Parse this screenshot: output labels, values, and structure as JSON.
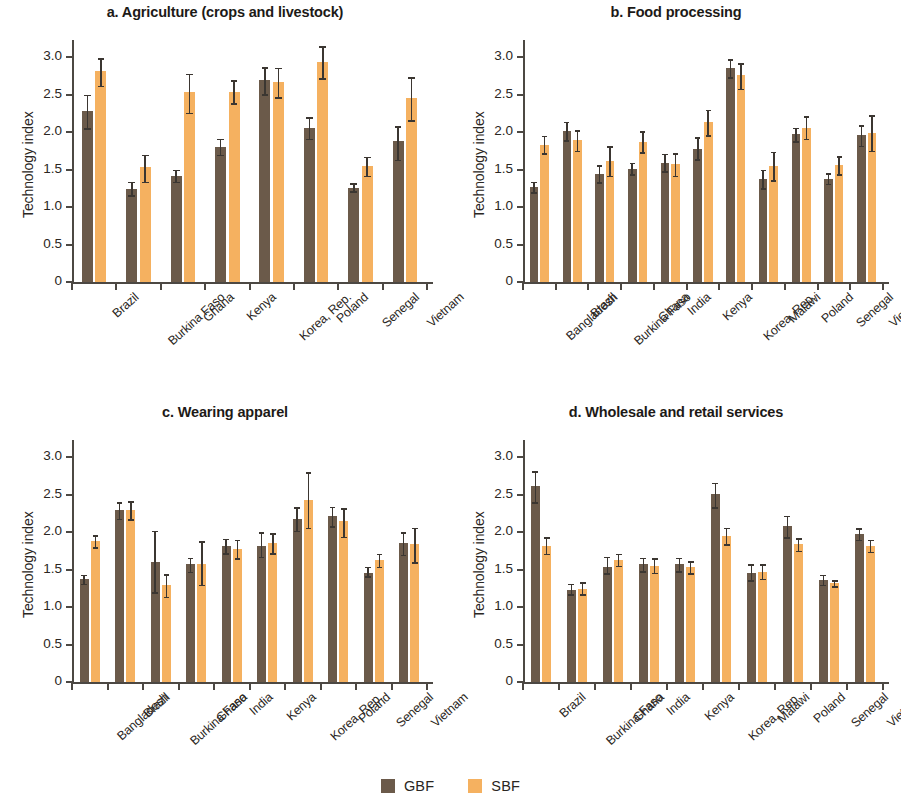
{
  "figure": {
    "ylabel": "Technology index",
    "ytick_labels": [
      "0",
      "0.5",
      "1.0",
      "1.5",
      "2.0",
      "2.5",
      "3.0"
    ]
  },
  "legend": {
    "position": "bottom-center",
    "items": [
      {
        "label": "GBF",
        "color": "#6b5a4a"
      },
      {
        "label": "SBF",
        "color": "#f5b160"
      }
    ]
  },
  "chart_data": [
    {
      "type": "bar",
      "panel": "a",
      "title": "a. Agriculture (crops and livestock)",
      "xlabel": "",
      "ylabel": "Technology index",
      "ylim": [
        0,
        3.15
      ],
      "yticks": [
        0,
        0.5,
        1.0,
        1.5,
        2.0,
        2.5,
        3.0
      ],
      "grid": false,
      "categories": [
        "Brazil",
        "Burkina Faso",
        "Ghana",
        "Kenya",
        "Korea, Rep.",
        "Poland",
        "Senegal",
        "Vietnam"
      ],
      "series": [
        {
          "name": "GBF",
          "color": "#6b5a4a",
          "values": [
            2.28,
            1.24,
            1.41,
            1.8,
            2.7,
            2.06,
            1.26,
            1.88
          ],
          "err_low": [
            2.05,
            1.16,
            1.34,
            1.7,
            2.51,
            1.91,
            1.21,
            1.63
          ],
          "err_high": [
            2.5,
            1.34,
            1.5,
            1.91,
            2.87,
            2.2,
            1.32,
            2.08
          ]
        },
        {
          "name": "SBF",
          "color": "#f5b160",
          "values": [
            2.82,
            1.53,
            2.53,
            2.54,
            2.67,
            2.93,
            1.55,
            2.45
          ],
          "err_low": [
            2.62,
            1.34,
            2.26,
            2.39,
            2.47,
            2.72,
            1.42,
            2.16
          ],
          "err_high": [
            2.99,
            1.7,
            2.78,
            2.69,
            2.86,
            3.15,
            1.67,
            2.73
          ]
        }
      ]
    },
    {
      "type": "bar",
      "panel": "b",
      "title": "b. Food processing",
      "xlabel": "",
      "ylabel": "Technology index",
      "ylim": [
        0,
        3.15
      ],
      "yticks": [
        0,
        0.5,
        1.0,
        1.5,
        2.0,
        2.5,
        3.0
      ],
      "grid": false,
      "categories": [
        "Bangladesh",
        "Brazil",
        "Burkina Faso",
        "Ghana",
        "India",
        "Kenya",
        "Korea, Rep.",
        "Malawi",
        "Poland",
        "Senegal",
        "Vietnam"
      ],
      "series": [
        {
          "name": "GBF",
          "color": "#6b5a4a",
          "values": [
            1.27,
            2.01,
            1.44,
            1.51,
            1.59,
            1.78,
            2.85,
            1.38,
            1.97,
            1.38,
            1.96
          ],
          "err_low": [
            1.2,
            1.89,
            1.33,
            1.44,
            1.48,
            1.64,
            2.73,
            1.25,
            1.88,
            1.31,
            1.82
          ],
          "err_high": [
            1.34,
            2.14,
            1.56,
            1.59,
            1.71,
            1.93,
            2.97,
            1.5,
            2.06,
            1.45,
            2.09
          ]
        },
        {
          "name": "SBF",
          "color": "#f5b160",
          "values": [
            1.83,
            1.89,
            1.62,
            1.87,
            1.57,
            2.14,
            2.76,
            1.55,
            2.06,
            1.56,
            1.99
          ],
          "err_low": [
            1.72,
            1.75,
            1.42,
            1.73,
            1.42,
            1.96,
            2.58,
            1.36,
            1.91,
            1.44,
            1.75
          ],
          "err_high": [
            1.95,
            2.03,
            1.81,
            2.01,
            1.72,
            2.3,
            2.92,
            1.74,
            2.21,
            1.68,
            2.23
          ]
        }
      ]
    },
    {
      "type": "bar",
      "panel": "c",
      "title": "c. Wearing apparel",
      "xlabel": "",
      "ylabel": "Technology index",
      "ylim": [
        0,
        3.15
      ],
      "yticks": [
        0,
        0.5,
        1.0,
        1.5,
        2.0,
        2.5,
        3.0
      ],
      "grid": false,
      "categories": [
        "Bangladesh",
        "Brazil",
        "Burkina Faso",
        "Ghana",
        "India",
        "Kenya",
        "Korea, Rep.",
        "Poland",
        "Senegal",
        "Vietnam"
      ],
      "series": [
        {
          "name": "GBF",
          "color": "#6b5a4a",
          "values": [
            1.37,
            2.29,
            1.6,
            1.58,
            1.81,
            1.82,
            2.17,
            2.21,
            1.46,
            1.85
          ],
          "err_low": [
            1.31,
            2.18,
            1.2,
            1.47,
            1.72,
            1.67,
            2.02,
            2.08,
            1.41,
            1.7
          ],
          "err_high": [
            1.43,
            2.4,
            2.02,
            1.66,
            1.91,
            2.0,
            2.33,
            2.34,
            1.54,
            2.0
          ]
        },
        {
          "name": "SBF",
          "color": "#f5b160",
          "values": [
            1.88,
            2.29,
            1.29,
            1.58,
            1.78,
            1.85,
            2.43,
            2.15,
            1.63,
            1.84
          ],
          "err_low": [
            1.8,
            2.17,
            1.14,
            1.3,
            1.65,
            1.72,
            2.06,
            1.94,
            1.54,
            1.6
          ],
          "err_high": [
            1.96,
            2.41,
            1.44,
            1.88,
            1.9,
            1.99,
            2.8,
            2.32,
            1.71,
            2.06
          ]
        }
      ]
    },
    {
      "type": "bar",
      "panel": "d",
      "title": "d. Wholesale and retail services",
      "xlabel": "",
      "ylabel": "Technology index",
      "ylim": [
        0,
        3.15
      ],
      "yticks": [
        0,
        0.5,
        1.0,
        1.5,
        2.0,
        2.5,
        3.0
      ],
      "grid": false,
      "categories": [
        "Brazil",
        "Burkina Faso",
        "Ghana",
        "India",
        "Kenya",
        "Korea, Rep.",
        "Malawi",
        "Poland",
        "Senegal",
        "Vietnam"
      ],
      "series": [
        {
          "name": "GBF",
          "color": "#6b5a4a",
          "values": [
            2.61,
            1.23,
            1.54,
            1.57,
            1.57,
            2.51,
            1.46,
            2.08,
            1.36,
            1.97
          ],
          "err_low": [
            2.4,
            1.17,
            1.45,
            1.48,
            1.48,
            2.33,
            1.36,
            1.93,
            1.3,
            1.9
          ],
          "err_high": [
            2.81,
            1.31,
            1.67,
            1.66,
            1.66,
            2.66,
            1.57,
            2.22,
            1.43,
            2.05
          ]
        },
        {
          "name": "SBF",
          "color": "#f5b160",
          "values": [
            1.81,
            1.24,
            1.63,
            1.55,
            1.53,
            1.95,
            1.47,
            1.84,
            1.32,
            1.82
          ],
          "err_low": [
            1.71,
            1.17,
            1.55,
            1.46,
            1.45,
            1.84,
            1.38,
            1.75,
            1.28,
            1.74
          ],
          "err_high": [
            1.93,
            1.33,
            1.71,
            1.65,
            1.61,
            2.06,
            1.57,
            1.92,
            1.36,
            1.9
          ]
        }
      ]
    }
  ]
}
